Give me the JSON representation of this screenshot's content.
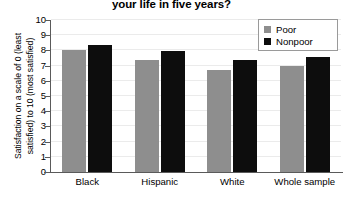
{
  "chart_data": {
    "type": "bar",
    "title": "your life in five years?",
    "xlabel": "",
    "ylabel_line_1": "Satisfaction on a scale of 0 (least",
    "ylabel_line_2": "satisfied) to 10 (most satisfied)",
    "ylim": [
      0,
      10
    ],
    "yticks": [
      0,
      1,
      2,
      3,
      4,
      5,
      6,
      7,
      8,
      9,
      10
    ],
    "ytick_labels": [
      "0",
      "1",
      "2",
      "3",
      "4",
      "5",
      "6",
      "7",
      "8",
      "9",
      "10"
    ],
    "grid": true,
    "legend_position": "top-right",
    "categories": [
      "Black",
      "Hispanic",
      "White",
      "Whole sample"
    ],
    "series": [
      {
        "name": "Poor",
        "color": "#8e8e8e",
        "values": [
          8.05,
          7.4,
          6.7,
          6.95
        ]
      },
      {
        "name": "Nonpoor",
        "color": "#0d0d0d",
        "values": [
          8.35,
          7.95,
          7.4,
          7.55
        ]
      }
    ]
  }
}
